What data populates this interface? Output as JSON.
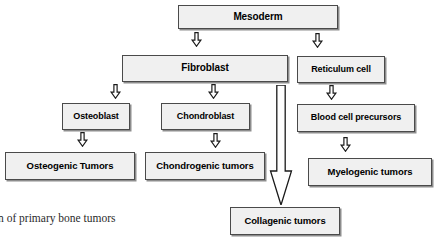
{
  "diagram": {
    "title_caption": "n of primary bone tumors",
    "colors": {
      "box_fill": "#f0f0f0",
      "box_border": "#4a4a4a",
      "box_shadow": "#8d8d8d",
      "arrow": "#1a1a1a",
      "background": "#ffffff",
      "text": "#000000"
    },
    "nodes": [
      {
        "id": "mesoderm",
        "label": "Mesoderm",
        "x": 178,
        "y": 5,
        "w": 160,
        "h": 24,
        "font_size": 10
      },
      {
        "id": "fibroblast",
        "label": "Fibroblast",
        "x": 122,
        "y": 55,
        "w": 166,
        "h": 27,
        "font_size": 10
      },
      {
        "id": "reticulum-cell",
        "label": "Reticulum cell",
        "x": 297,
        "y": 56,
        "w": 88,
        "h": 27,
        "font_size": 9
      },
      {
        "id": "osteoblast",
        "label": "Osteoblast",
        "x": 62,
        "y": 103,
        "w": 68,
        "h": 27,
        "font_size": 9
      },
      {
        "id": "chondroblast",
        "label": "Chondroblast",
        "x": 161,
        "y": 103,
        "w": 89,
        "h": 27,
        "font_size": 9
      },
      {
        "id": "blood-cell-precursors",
        "label": "Blood cell precursors",
        "x": 297,
        "y": 104,
        "w": 118,
        "h": 28,
        "font_size": 9
      },
      {
        "id": "osteogenic-tumors",
        "label": "Osteogenic Tumors",
        "x": 5,
        "y": 152,
        "w": 130,
        "h": 28,
        "font_size": 9.5
      },
      {
        "id": "chondrogenic-tumors",
        "label": "Chondrogenic tumors",
        "x": 145,
        "y": 152,
        "w": 120,
        "h": 28,
        "font_size": 9.5
      },
      {
        "id": "myelogenic-tumors",
        "label": "Myelogenic tumors",
        "x": 308,
        "y": 158,
        "w": 124,
        "h": 28,
        "font_size": 9.5
      },
      {
        "id": "collagenic-tumors",
        "label": "Collagenic tumors",
        "x": 230,
        "y": 207,
        "w": 110,
        "h": 28,
        "font_size": 9.5
      }
    ],
    "arrows": [
      {
        "id": "mesoderm-to-fibroblast",
        "from": "mesoderm",
        "to": "fibroblast",
        "glyph": "arrow-down-hollow",
        "x": 189,
        "y": 32,
        "size": 15
      },
      {
        "id": "mesoderm-to-reticulum-cell",
        "from": "mesoderm",
        "to": "reticulum-cell",
        "glyph": "arrow-down-hollow",
        "x": 310,
        "y": 33,
        "size": 15
      },
      {
        "id": "fibroblast-to-osteoblast",
        "from": "fibroblast",
        "to": "osteoblast",
        "glyph": "arrow-down-hollow",
        "x": 108,
        "y": 84,
        "size": 15
      },
      {
        "id": "fibroblast-to-chondroblast",
        "from": "fibroblast",
        "to": "chondroblast",
        "glyph": "arrow-down-hollow",
        "x": 206,
        "y": 84,
        "size": 15
      },
      {
        "id": "reticulum-to-blood-cell-precursors",
        "from": "reticulum-cell",
        "to": "blood-cell-precursors",
        "glyph": "arrow-down-hollow",
        "x": 324,
        "y": 85,
        "size": 15
      },
      {
        "id": "osteoblast-to-osteogenic-tumors",
        "from": "osteoblast",
        "to": "osteogenic-tumors",
        "glyph": "arrow-down-hollow",
        "x": 75,
        "y": 132,
        "size": 15
      },
      {
        "id": "chondroblast-to-chondrogenic",
        "from": "chondroblast",
        "to": "chondrogenic-tumors",
        "glyph": "arrow-down-hollow",
        "x": 208,
        "y": 133,
        "size": 15
      },
      {
        "id": "blood-precursors-to-myelogenic",
        "from": "blood-cell-precursors",
        "to": "myelogenic-tumors",
        "glyph": "arrow-down-hollow",
        "x": 338,
        "y": 137,
        "size": 15
      },
      {
        "id": "fibroblast-to-collagenic-tumors",
        "from": "fibroblast",
        "to": "collagenic-tumors",
        "glyph": "arrow-down-long-hollow",
        "x": 268,
        "y": 85,
        "w": 26,
        "h": 120
      }
    ]
  }
}
